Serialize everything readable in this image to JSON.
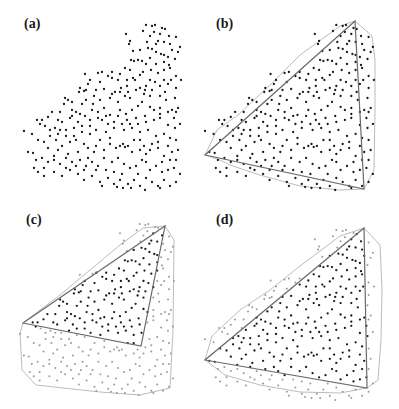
{
  "figure": {
    "panels": [
      {
        "id": "a",
        "label": "(a)",
        "label_pos": [
          24,
          17
        ]
      },
      {
        "id": "b",
        "label": "(b)",
        "label_pos": [
          216,
          17
        ]
      },
      {
        "id": "c",
        "label": "(c)",
        "label_pos": [
          26,
          213
        ]
      },
      {
        "id": "d",
        "label": "(d)",
        "label_pos": [
          216,
          213
        ]
      }
    ],
    "colors": {
      "point_inside": "#1a1a1a",
      "point_outside": "#9a9a9a",
      "triangle": "#6a6a6a",
      "hull": "#b4b4b4"
    },
    "transforms": {
      "a": {
        "x0": 24,
        "sx": 1.0,
        "dx": 24,
        "y0": 25,
        "sy": 1.0,
        "dy": 25
      },
      "b": {
        "x0": 24,
        "sx": 1.076,
        "dx": 205,
        "y0": 25,
        "sy": 1.0,
        "dy": 25
      },
      "c": {
        "x0": 24,
        "sx": 0.98,
        "dx": 20,
        "y0": 25,
        "sy": 1.036,
        "dy": 224
      },
      "d": {
        "x0": 24,
        "sx": 1.076,
        "dx": 205,
        "y0": 25,
        "sy": 1.03,
        "dy": 230
      }
    },
    "triangles": {
      "b": [
        [
          355,
          21
        ],
        [
          205,
          155
        ],
        [
          364,
          189
        ]
      ],
      "c": [
        [
          165,
          226
        ],
        [
          23,
          323
        ],
        [
          141,
          346
        ]
      ],
      "d": [
        [
          364,
          228
        ],
        [
          205,
          360
        ],
        [
          367,
          388
        ]
      ]
    },
    "hulls": {
      "b": [
        [
          205,
          155
        ],
        [
          217,
          130
        ],
        [
          238,
          115
        ],
        [
          270,
          85
        ],
        [
          300,
          55
        ],
        [
          340,
          26
        ],
        [
          355,
          21
        ],
        [
          372,
          36
        ],
        [
          375,
          60
        ],
        [
          375,
          110
        ],
        [
          374,
          170
        ],
        [
          364,
          189
        ],
        [
          340,
          190
        ],
        [
          300,
          186
        ],
        [
          260,
          175
        ],
        [
          230,
          165
        ],
        [
          220,
          160
        ]
      ],
      "c": [
        [
          23,
          323
        ],
        [
          20,
          333
        ],
        [
          22,
          370
        ],
        [
          36,
          385
        ],
        [
          100,
          392
        ],
        [
          140,
          395
        ],
        [
          170,
          388
        ],
        [
          173,
          330
        ],
        [
          174,
          240
        ],
        [
          165,
          226
        ],
        [
          143,
          228
        ],
        [
          120,
          245
        ],
        [
          90,
          270
        ],
        [
          60,
          295
        ],
        [
          40,
          310
        ]
      ],
      "d": [
        [
          205,
          360
        ],
        [
          212,
          336
        ],
        [
          240,
          310
        ],
        [
          270,
          290
        ],
        [
          300,
          266
        ],
        [
          340,
          236
        ],
        [
          364,
          228
        ],
        [
          380,
          245
        ],
        [
          382,
          290
        ],
        [
          381,
          340
        ],
        [
          378,
          380
        ],
        [
          367,
          388
        ],
        [
          340,
          393
        ],
        [
          300,
          392
        ],
        [
          260,
          385
        ],
        [
          225,
          375
        ]
      ]
    },
    "base_points": [
      [
        146,
        25
      ],
      [
        152,
        26
      ],
      [
        155,
        25
      ],
      [
        162,
        28
      ],
      [
        165,
        29
      ],
      [
        143,
        31
      ],
      [
        126,
        34
      ],
      [
        154,
        32
      ],
      [
        169,
        36
      ],
      [
        176,
        37
      ],
      [
        147,
        42
      ],
      [
        130,
        41
      ],
      [
        129,
        44
      ],
      [
        158,
        41
      ],
      [
        164,
        42
      ],
      [
        152,
        49
      ],
      [
        133,
        51
      ],
      [
        180,
        47
      ],
      [
        172,
        50
      ],
      [
        156,
        52
      ],
      [
        161,
        54
      ],
      [
        164,
        55
      ],
      [
        168,
        57
      ],
      [
        150,
        58
      ],
      [
        175,
        59
      ],
      [
        131,
        60
      ],
      [
        134,
        61
      ],
      [
        142,
        61
      ],
      [
        169,
        65
      ],
      [
        170,
        68
      ],
      [
        164,
        70
      ],
      [
        125,
        68
      ],
      [
        151,
        70
      ],
      [
        143,
        72
      ],
      [
        158,
        73
      ],
      [
        140,
        75
      ],
      [
        133,
        78
      ],
      [
        176,
        76
      ],
      [
        102,
        72
      ],
      [
        108,
        76
      ],
      [
        112,
        78
      ],
      [
        118,
        80
      ],
      [
        127,
        80
      ],
      [
        135,
        80
      ],
      [
        150,
        80
      ],
      [
        155,
        82
      ],
      [
        164,
        80
      ],
      [
        171,
        80
      ],
      [
        181,
        80
      ],
      [
        146,
        86
      ],
      [
        140,
        88
      ],
      [
        145,
        90
      ],
      [
        165,
        92
      ],
      [
        175,
        98
      ],
      [
        85,
        74
      ],
      [
        98,
        73
      ],
      [
        90,
        80
      ],
      [
        100,
        82
      ],
      [
        88,
        84
      ],
      [
        80,
        88
      ],
      [
        84,
        91
      ],
      [
        79,
        92
      ],
      [
        86,
        90
      ],
      [
        96,
        90
      ],
      [
        104,
        89
      ],
      [
        121,
        88
      ],
      [
        127,
        86
      ],
      [
        115,
        92
      ],
      [
        125,
        96
      ],
      [
        110,
        98
      ],
      [
        100,
        100
      ],
      [
        118,
        102
      ],
      [
        130,
        98
      ],
      [
        142,
        102
      ],
      [
        150,
        107
      ],
      [
        160,
        108
      ],
      [
        172,
        110
      ],
      [
        178,
        108
      ],
      [
        176,
        112
      ],
      [
        65,
        98
      ],
      [
        68,
        100
      ],
      [
        72,
        102
      ],
      [
        64,
        104
      ],
      [
        60,
        112
      ],
      [
        72,
        110
      ],
      [
        76,
        112
      ],
      [
        85,
        116
      ],
      [
        90,
        120
      ],
      [
        78,
        122
      ],
      [
        70,
        118
      ],
      [
        98,
        112
      ],
      [
        104,
        108
      ],
      [
        110,
        115
      ],
      [
        118,
        116
      ],
      [
        126,
        114
      ],
      [
        136,
        118
      ],
      [
        145,
        116
      ],
      [
        154,
        120
      ],
      [
        160,
        118
      ],
      [
        168,
        125
      ],
      [
        175,
        128
      ],
      [
        180,
        124
      ],
      [
        52,
        112
      ],
      [
        48,
        117
      ],
      [
        42,
        120
      ],
      [
        40,
        124
      ],
      [
        37,
        120
      ],
      [
        45,
        126
      ],
      [
        55,
        128
      ],
      [
        60,
        130
      ],
      [
        66,
        130
      ],
      [
        74,
        128
      ],
      [
        82,
        132
      ],
      [
        90,
        134
      ],
      [
        96,
        130
      ],
      [
        106,
        132
      ],
      [
        114,
        128
      ],
      [
        124,
        130
      ],
      [
        132,
        128
      ],
      [
        140,
        132
      ],
      [
        148,
        130
      ],
      [
        156,
        136
      ],
      [
        164,
        134
      ],
      [
        170,
        138
      ],
      [
        176,
        140
      ],
      [
        24,
        131
      ],
      [
        32,
        134
      ],
      [
        38,
        140
      ],
      [
        44,
        142
      ],
      [
        50,
        136
      ],
      [
        56,
        140
      ],
      [
        62,
        146
      ],
      [
        70,
        142
      ],
      [
        76,
        140
      ],
      [
        84,
        144
      ],
      [
        88,
        148
      ],
      [
        96,
        146
      ],
      [
        104,
        150
      ],
      [
        110,
        144
      ],
      [
        116,
        148
      ],
      [
        120,
        146
      ],
      [
        123,
        144
      ],
      [
        125,
        147
      ],
      [
        128,
        146
      ],
      [
        132,
        152
      ],
      [
        140,
        150
      ],
      [
        146,
        154
      ],
      [
        150,
        150
      ],
      [
        158,
        148
      ],
      [
        164,
        156
      ],
      [
        172,
        152
      ],
      [
        178,
        150
      ],
      [
        28,
        152
      ],
      [
        33,
        153
      ],
      [
        36,
        160
      ],
      [
        42,
        158
      ],
      [
        48,
        162
      ],
      [
        54,
        160
      ],
      [
        60,
        164
      ],
      [
        66,
        158
      ],
      [
        72,
        162
      ],
      [
        80,
        160
      ],
      [
        86,
        166
      ],
      [
        92,
        162
      ],
      [
        98,
        166
      ],
      [
        106,
        170
      ],
      [
        112,
        162
      ],
      [
        118,
        158
      ],
      [
        124,
        164
      ],
      [
        130,
        168
      ],
      [
        136,
        166
      ],
      [
        142,
        160
      ],
      [
        150,
        170
      ],
      [
        156,
        166
      ],
      [
        162,
        172
      ],
      [
        168,
        170
      ],
      [
        174,
        168
      ],
      [
        180,
        174
      ],
      [
        34,
        168
      ],
      [
        38,
        172
      ],
      [
        44,
        176
      ],
      [
        54,
        172
      ],
      [
        62,
        176
      ],
      [
        70,
        170
      ],
      [
        78,
        174
      ],
      [
        84,
        180
      ],
      [
        92,
        176
      ],
      [
        100,
        182
      ],
      [
        108,
        178
      ],
      [
        114,
        184
      ],
      [
        120,
        180
      ],
      [
        128,
        184
      ],
      [
        134,
        180
      ],
      [
        140,
        186
      ],
      [
        146,
        178
      ],
      [
        152,
        182
      ],
      [
        158,
        186
      ],
      [
        164,
        180
      ],
      [
        170,
        186
      ],
      [
        176,
        182
      ],
      [
        102,
        186
      ],
      [
        117,
        187
      ],
      [
        123,
        188
      ],
      [
        131,
        188
      ],
      [
        145,
        190
      ],
      [
        160,
        188
      ],
      [
        92,
        110
      ],
      [
        93,
        104
      ],
      [
        82,
        104
      ],
      [
        58,
        120
      ],
      [
        102,
        120
      ],
      [
        108,
        124
      ],
      [
        132,
        110
      ],
      [
        138,
        106
      ],
      [
        160,
        96
      ],
      [
        166,
        100
      ],
      [
        150,
        96
      ],
      [
        120,
        110
      ],
      [
        127,
        120
      ],
      [
        140,
        140
      ],
      [
        134,
        140
      ],
      [
        110,
        138
      ],
      [
        100,
        140
      ],
      [
        94,
        152
      ],
      [
        88,
        158
      ],
      [
        78,
        152
      ],
      [
        68,
        154
      ],
      [
        58,
        150
      ],
      [
        48,
        148
      ],
      [
        54,
        156
      ],
      [
        44,
        168
      ],
      [
        114,
        172
      ],
      [
        122,
        174
      ],
      [
        138,
        174
      ],
      [
        146,
        162
      ],
      [
        162,
        162
      ],
      [
        170,
        160
      ],
      [
        176,
        160
      ],
      [
        104,
        158
      ],
      [
        96,
        170
      ],
      [
        84,
        170
      ],
      [
        76,
        166
      ],
      [
        66,
        168
      ],
      [
        158,
        142
      ],
      [
        152,
        144
      ],
      [
        144,
        146
      ],
      [
        168,
        146
      ],
      [
        174,
        118
      ],
      [
        168,
        112
      ],
      [
        160,
        114
      ],
      [
        154,
        110
      ],
      [
        146,
        122
      ],
      [
        138,
        124
      ],
      [
        130,
        124
      ],
      [
        122,
        124
      ],
      [
        114,
        122
      ],
      [
        106,
        116
      ],
      [
        98,
        118
      ],
      [
        90,
        126
      ],
      [
        82,
        126
      ],
      [
        74,
        136
      ],
      [
        66,
        136
      ],
      [
        58,
        134
      ],
      [
        50,
        130
      ],
      [
        62,
        122
      ],
      [
        72,
        116
      ],
      [
        80,
        114
      ],
      [
        86,
        100
      ],
      [
        94,
        96
      ],
      [
        112,
        94
      ],
      [
        120,
        92
      ],
      [
        128,
        92
      ],
      [
        136,
        90
      ],
      [
        144,
        94
      ],
      [
        152,
        90
      ],
      [
        160,
        86
      ],
      [
        168,
        84
      ],
      [
        176,
        88
      ],
      [
        138,
        60
      ],
      [
        146,
        64
      ],
      [
        156,
        64
      ],
      [
        164,
        62
      ],
      [
        130,
        70
      ],
      [
        120,
        74
      ],
      [
        112,
        72
      ],
      [
        150,
        36
      ],
      [
        160,
        34
      ],
      [
        170,
        44
      ],
      [
        178,
        52
      ],
      [
        140,
        50
      ],
      [
        148,
        48
      ],
      [
        156,
        44
      ]
    ]
  }
}
